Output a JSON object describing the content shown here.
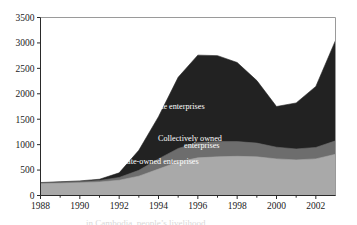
{
  "chart_data": {
    "type": "area",
    "stacked": true,
    "title": "",
    "xlabel": "",
    "ylabel": "",
    "x": [
      1988,
      1989,
      1990,
      1991,
      1992,
      1993,
      1994,
      1995,
      1996,
      1997,
      1998,
      1999,
      2000,
      2001,
      2002,
      2003
    ],
    "xlim": [
      1988,
      2003
    ],
    "ylim": [
      0,
      3500
    ],
    "xticks": [
      1988,
      1990,
      1992,
      1994,
      1996,
      1998,
      2000,
      2002
    ],
    "xticklabels": [
      "1988",
      "1990",
      "1992",
      "1994",
      "1996",
      "1998",
      "2000",
      "2002"
    ],
    "yticks": [
      0,
      500,
      1000,
      1500,
      2000,
      2500,
      3000,
      3500
    ],
    "yticklabels": [
      "0",
      "500",
      "1000",
      "1500",
      "2000",
      "2500",
      "3000",
      "3500"
    ],
    "minor_xticks": true,
    "grid": false,
    "legend_position": "inline-annotations",
    "series": [
      {
        "name": "State-owned enterprises",
        "color": "#a9a9a9",
        "label_x": 1994.05,
        "label_y": 620,
        "values": [
          230,
          240,
          250,
          265,
          300,
          380,
          520,
          660,
          740,
          760,
          770,
          760,
          720,
          700,
          720,
          810
        ]
      },
      {
        "name": "Collectively owned enterprises",
        "color": "#6d6d6d",
        "label_x": 1995.6,
        "label_y": 1080,
        "label_line2_x": 1996.2,
        "values": [
          20,
          22,
          25,
          30,
          55,
          115,
          200,
          265,
          300,
          300,
          290,
          270,
          230,
          215,
          225,
          265
        ]
      },
      {
        "name": "Private enterprises",
        "color": "#222222",
        "label_x": 1994.8,
        "label_y": 1700,
        "values": [
          5,
          8,
          12,
          25,
          90,
          395,
          830,
          1400,
          1720,
          1690,
          1555,
          1230,
          800,
          905,
          1200,
          1975
        ]
      }
    ],
    "totals": [
      255,
      270,
      287,
      320,
      445,
      890,
      1550,
      2325,
      2760,
      2750,
      2615,
      2260,
      1750,
      1820,
      2145,
      3050
    ]
  },
  "annotations": {
    "private": "Private enterprises",
    "collective_line1": "Collectively owned",
    "collective_line2": "enterprises",
    "state": "State-owned enterprises"
  },
  "caption": {
    "text": "in Cambodia, people’s livelihood"
  }
}
